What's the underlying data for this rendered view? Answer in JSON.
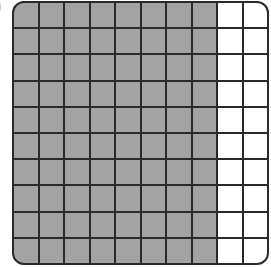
{
  "label_mark": ")",
  "grid": {
    "rows": 10,
    "columns": 10,
    "shaded_columns": 8,
    "shaded_count": 80,
    "total_cells": 100,
    "colors": {
      "shaded": "#a3a3a3",
      "unshaded": "#ffffff",
      "lines": "#2a2a2a"
    }
  }
}
